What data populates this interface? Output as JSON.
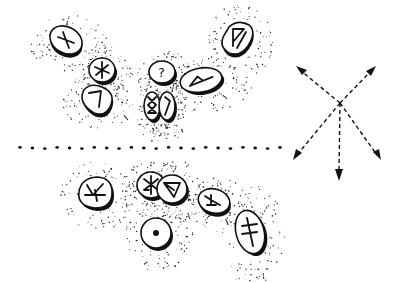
{
  "illustration": {
    "subject": "rune stones cast on the ground with a divider line and direction arrows",
    "colors": {
      "ink": "#111111",
      "background": "#ffffff"
    },
    "upper_group": {
      "stones": [
        {
          "id": "stone-gebo",
          "rune": "X",
          "cx": 66,
          "cy": 40,
          "rx": 17,
          "ry": 13,
          "rot": 30
        },
        {
          "id": "stone-hagalaz",
          "rune": "asterisk",
          "cx": 102,
          "cy": 70,
          "rx": 12,
          "ry": 12,
          "rot": 0
        },
        {
          "id": "stone-kenaz",
          "rune": "7",
          "cx": 96,
          "cy": 98,
          "rx": 16,
          "ry": 13,
          "rot": 15
        },
        {
          "id": "stone-blank",
          "rune": "?",
          "label": "?",
          "cx": 162,
          "cy": 72,
          "rx": 12,
          "ry": 11,
          "rot": 0
        },
        {
          "id": "stone-othala",
          "rune": "othala",
          "cx": 152,
          "cy": 106,
          "rx": 8,
          "ry": 14,
          "rot": 0
        },
        {
          "id": "stone-laguz",
          "rune": "laguz",
          "cx": 167,
          "cy": 106,
          "rx": 8,
          "ry": 14,
          "rot": 0
        },
        {
          "id": "stone-thurisaz",
          "rune": "thurisaz",
          "cx": 201,
          "cy": 80,
          "rx": 21,
          "ry": 12,
          "rot": -10
        },
        {
          "id": "stone-wunjo",
          "rune": "wunjo",
          "cx": 238,
          "cy": 38,
          "rx": 14,
          "ry": 17,
          "rot": 20
        }
      ]
    },
    "divider": {
      "type": "dotted",
      "x1": 20,
      "x2": 280,
      "y": 148,
      "dot_count": 22
    },
    "lower_group": {
      "stones": [
        {
          "id": "stone-algiz-inverted",
          "rune": "4",
          "cx": 95,
          "cy": 192,
          "rx": 17,
          "ry": 15,
          "rot": 0
        },
        {
          "id": "stone-hagalaz-b",
          "rune": "hagalaz",
          "cx": 151,
          "cy": 185,
          "rx": 14,
          "ry": 13,
          "rot": 0
        },
        {
          "id": "stone-y",
          "rune": "Y-triangle",
          "cx": 172,
          "cy": 189,
          "rx": 14,
          "ry": 14,
          "rot": 0
        },
        {
          "id": "stone-sowilo-dot",
          "rune": "dot",
          "cx": 156,
          "cy": 233,
          "rx": 15,
          "ry": 15,
          "rot": 0
        },
        {
          "id": "stone-algiz",
          "rune": "algiz",
          "cx": 214,
          "cy": 201,
          "rx": 15,
          "ry": 12,
          "rot": 15
        },
        {
          "id": "stone-dagger",
          "rune": "double-cross",
          "cx": 250,
          "cy": 232,
          "rx": 14,
          "ry": 22,
          "rot": -15
        }
      ]
    },
    "arrows": {
      "center": {
        "x": 340,
        "y": 103
      },
      "directions": [
        {
          "name": "up-left",
          "x": 296,
          "y": 66
        },
        {
          "name": "up-right",
          "x": 376,
          "y": 66
        },
        {
          "name": "down-left",
          "x": 293,
          "y": 160
        },
        {
          "name": "down",
          "x": 339,
          "y": 180
        },
        {
          "name": "down-right",
          "x": 381,
          "y": 160
        }
      ]
    }
  }
}
